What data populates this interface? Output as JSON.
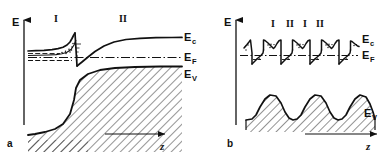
{
  "figure": {
    "type": "energy-band-diagram",
    "panels": [
      {
        "id": "a",
        "id_label": "a",
        "axis": {
          "y_label": "E",
          "x_label": "z"
        },
        "region_labels": [
          "I",
          "II"
        ],
        "band_labels": {
          "conduction": "E",
          "conduction_sub": "c",
          "fermi": "E",
          "fermi_sub": "F",
          "valence": "E",
          "valence_sub": "V"
        },
        "description": "Type-II heterojunction band bending with electron accumulation notch at interface"
      },
      {
        "id": "b",
        "id_label": "b",
        "axis": {
          "y_label": "E",
          "x_label": "z"
        },
        "region_labels": [
          "I",
          "II",
          "I",
          "II"
        ],
        "band_labels": {
          "conduction": "E",
          "conduction_sub": "c",
          "fermi": "E",
          "fermi_sub": "F",
          "valence": "E",
          "valence_sub": "V"
        },
        "description": "Superlattice of alternating layers with periodic quantum wells and valence band humps"
      }
    ],
    "colors": {
      "ink": "#111111",
      "background": "#ffffff"
    }
  }
}
